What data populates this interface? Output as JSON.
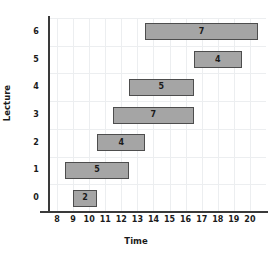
{
  "chart_data": {
    "type": "bar",
    "orientation": "horizontal",
    "title": "",
    "xlabel": "Time",
    "ylabel": "Lecture",
    "xlim": [
      7.5,
      21
    ],
    "ylim": [
      -0.5,
      6.5
    ],
    "grid": true,
    "legend": null,
    "xticks": [
      "8",
      "9",
      "10",
      "11",
      "12",
      "13",
      "14",
      "15",
      "16",
      "17",
      "18",
      "19",
      "20"
    ],
    "xtick_values": [
      8,
      9,
      10,
      11,
      12,
      13,
      14,
      15,
      16,
      17,
      18,
      19,
      20
    ],
    "yticks": [
      "0",
      "1",
      "2",
      "3",
      "4",
      "5",
      "6"
    ],
    "ytick_values": [
      0,
      1,
      2,
      3,
      4,
      5,
      6
    ],
    "bar_fill_color": "#a5a5a5",
    "bar_edge_color": "#4d4d4d",
    "grid_color": "#eceef0",
    "axis_color": "#3a3a3a",
    "categories": [
      "0",
      "1",
      "2",
      "3",
      "4",
      "5",
      "6"
    ],
    "bars": [
      {
        "lecture": 0,
        "start": 9.0,
        "end": 10.5,
        "duration": 1.5,
        "label": "2"
      },
      {
        "lecture": 1,
        "start": 8.5,
        "end": 12.5,
        "duration": 4.0,
        "label": "5"
      },
      {
        "lecture": 2,
        "start": 10.5,
        "end": 13.5,
        "duration": 3.0,
        "label": "4"
      },
      {
        "lecture": 3,
        "start": 11.5,
        "end": 16.5,
        "duration": 5.0,
        "label": "7"
      },
      {
        "lecture": 4,
        "start": 12.5,
        "end": 16.5,
        "duration": 4.0,
        "label": "5"
      },
      {
        "lecture": 5,
        "start": 16.5,
        "end": 19.5,
        "duration": 3.0,
        "label": "4"
      },
      {
        "lecture": 6,
        "start": 13.5,
        "end": 20.5,
        "duration": 7.0,
        "label": "7"
      }
    ]
  }
}
